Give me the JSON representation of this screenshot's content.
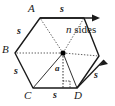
{
  "figure": {
    "shape": "regular hexagon",
    "vertices": [
      {
        "id": "A",
        "label": "A",
        "position": "top"
      },
      {
        "id": "B",
        "label": "B",
        "position": "left"
      },
      {
        "id": "C",
        "label": "C",
        "position": "bottom-left"
      },
      {
        "id": "D",
        "label": "D",
        "position": "bottom-right"
      }
    ],
    "side_labels": [
      {
        "id": "s-top",
        "label": "s",
        "edge": "A to next vertex (top edge, with arrow)"
      },
      {
        "id": "s-upper-left",
        "label": "s",
        "edge": "A to B"
      },
      {
        "id": "s-lower-left",
        "label": "s",
        "edge": "B to C"
      },
      {
        "id": "s-bottom",
        "label": "s",
        "edge": "C to D"
      },
      {
        "id": "s-right",
        "label": "s",
        "edge": "D upward (with arrow)"
      }
    ],
    "apothem_label": "a",
    "annotation": {
      "variable": "n",
      "text": " sides",
      "full": "n sides"
    },
    "colors": {
      "stroke": "#1a1a1a",
      "dotted": "#4d4d4d",
      "background": "#ffffff",
      "center_dot": "#000000"
    }
  }
}
